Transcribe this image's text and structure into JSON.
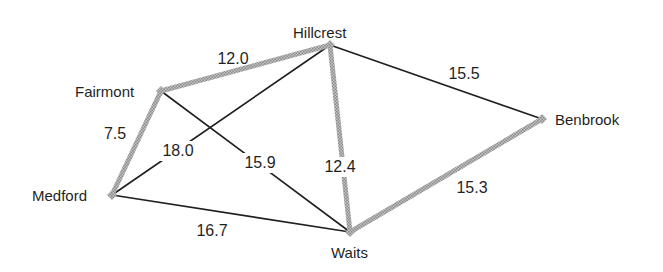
{
  "diagram": {
    "type": "weighted-graph",
    "colors": {
      "tree_edge": "#a8a8a8",
      "tree_edge_dark": "#7a7a7a",
      "other_edge": "#1f1f1f",
      "text": "#1f1f1f",
      "background": "#ffffff"
    },
    "nodes": [
      {
        "id": "fairmont",
        "label": "Fairmont",
        "x": 161,
        "y": 91,
        "label_x": 75,
        "label_y": 97,
        "anchor": "start"
      },
      {
        "id": "hillcrest",
        "label": "Hillcrest",
        "x": 330,
        "y": 45,
        "label_x": 293,
        "label_y": 38,
        "anchor": "start"
      },
      {
        "id": "medford",
        "label": "Medford",
        "x": 112,
        "y": 195,
        "label_x": 32,
        "label_y": 201,
        "anchor": "start"
      },
      {
        "id": "waits",
        "label": "Waits",
        "x": 350,
        "y": 232,
        "label_x": 331,
        "label_y": 258,
        "anchor": "start"
      },
      {
        "id": "benbrook",
        "label": "Benbrook",
        "x": 542,
        "y": 119,
        "label_x": 555,
        "label_y": 125,
        "anchor": "start"
      }
    ],
    "edges": [
      {
        "from": "fairmont",
        "to": "hillcrest",
        "weight": "12.0",
        "highlighted": true,
        "label_x": 233,
        "label_y": 64,
        "gap": false
      },
      {
        "from": "fairmont",
        "to": "medford",
        "weight": "7.5",
        "highlighted": true,
        "label_x": 115,
        "label_y": 139,
        "gap": false
      },
      {
        "from": "hillcrest",
        "to": "waits",
        "weight": "12.4",
        "highlighted": true,
        "label_x": 340,
        "label_y": 172,
        "gap": true
      },
      {
        "from": "waits",
        "to": "benbrook",
        "weight": "15.3",
        "highlighted": true,
        "label_x": 472,
        "label_y": 193,
        "gap": false
      },
      {
        "from": "hillcrest",
        "to": "benbrook",
        "weight": "15.5",
        "highlighted": false,
        "label_x": 464,
        "label_y": 79,
        "gap": false
      },
      {
        "from": "hillcrest",
        "to": "medford",
        "weight": "18.0",
        "highlighted": false,
        "label_x": 178,
        "label_y": 156,
        "gap": true
      },
      {
        "from": "fairmont",
        "to": "waits",
        "weight": "15.9",
        "highlighted": false,
        "label_x": 260,
        "label_y": 168,
        "gap": true
      },
      {
        "from": "medford",
        "to": "waits",
        "weight": "16.7",
        "highlighted": false,
        "label_x": 212,
        "label_y": 236,
        "gap": false
      }
    ]
  }
}
